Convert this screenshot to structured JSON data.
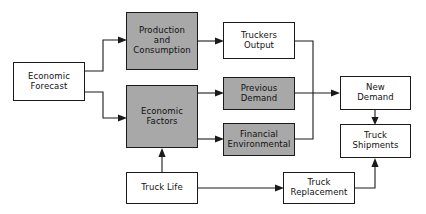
{
  "diagram": {
    "type": "flowchart",
    "colors": {
      "shaded_fill": "#a8a8a8",
      "plain_fill": "#ffffff",
      "stroke": "#1a1a1a",
      "background": "#ffffff"
    },
    "nodes": [
      {
        "id": "economic-forecast",
        "label": "Economic\nForecast",
        "style": "plain",
        "x": 13,
        "y": 62,
        "w": 72,
        "h": 39
      },
      {
        "id": "production-and-consumption",
        "label": "Production\nand\nConsumption",
        "style": "shaded",
        "x": 126,
        "y": 12,
        "w": 72,
        "h": 58
      },
      {
        "id": "economic-factors",
        "label": "Economic\nFactors",
        "style": "shaded",
        "x": 126,
        "y": 85,
        "w": 72,
        "h": 63
      },
      {
        "id": "truckers-output",
        "label": "Truckers\nOutput",
        "style": "plain",
        "x": 223,
        "y": 22,
        "w": 72,
        "h": 37
      },
      {
        "id": "previous-demand",
        "label": "Previous\nDemand",
        "style": "shaded",
        "x": 223,
        "y": 77,
        "w": 72,
        "h": 33
      },
      {
        "id": "financial-environmental",
        "label": "Financial\nEnvironmental",
        "style": "shaded",
        "x": 223,
        "y": 123,
        "w": 72,
        "h": 33
      },
      {
        "id": "new-demand",
        "label": "New\nDemand",
        "style": "plain",
        "x": 340,
        "y": 76,
        "w": 71,
        "h": 34
      },
      {
        "id": "truck-shipments",
        "label": "Truck\nShipments",
        "style": "plain",
        "x": 340,
        "y": 124,
        "w": 71,
        "h": 34
      },
      {
        "id": "truck-life",
        "label": "Truck Life",
        "style": "plain",
        "x": 126,
        "y": 172,
        "w": 72,
        "h": 32
      },
      {
        "id": "truck-replacement",
        "label": "Truck\nReplacement",
        "style": "plain",
        "x": 283,
        "y": 172,
        "w": 72,
        "h": 32
      }
    ],
    "edges": [
      {
        "id": "forecast-to-production",
        "from": "economic-forecast",
        "to": "production-and-consumption",
        "arrow": true
      },
      {
        "id": "forecast-to-factors",
        "from": "economic-forecast",
        "to": "economic-factors",
        "arrow": true
      },
      {
        "id": "production-to-truckers-output",
        "from": "production-and-consumption",
        "to": "truckers-output",
        "arrow": true
      },
      {
        "id": "factors-to-previous-demand",
        "from": "economic-factors",
        "to": "previous-demand",
        "arrow": true
      },
      {
        "id": "factors-to-financial-environmental",
        "from": "economic-factors",
        "to": "financial-environmental",
        "arrow": true
      },
      {
        "id": "truckers-output-to-new-demand",
        "from": "truckers-output",
        "to": "new-demand",
        "arrow": false
      },
      {
        "id": "previous-demand-to-new-demand",
        "from": "previous-demand",
        "to": "new-demand",
        "arrow": true
      },
      {
        "id": "financial-environmental-to-new-demand",
        "from": "financial-environmental",
        "to": "new-demand",
        "arrow": false
      },
      {
        "id": "new-demand-to-truck-shipments",
        "from": "new-demand",
        "to": "truck-shipments",
        "arrow": true
      },
      {
        "id": "truck-life-to-economic-factors",
        "from": "truck-life",
        "to": "economic-factors",
        "arrow": true
      },
      {
        "id": "truck-life-to-truck-replacement",
        "from": "truck-life",
        "to": "truck-replacement",
        "arrow": true
      },
      {
        "id": "truck-replacement-to-truck-shipments",
        "from": "truck-replacement",
        "to": "truck-shipments",
        "arrow": true
      }
    ]
  }
}
